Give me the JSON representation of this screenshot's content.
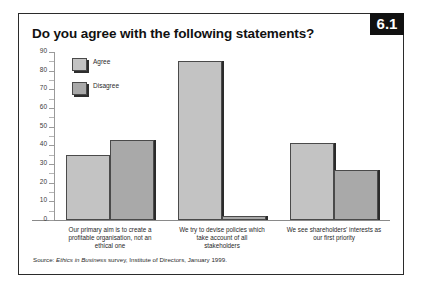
{
  "figure": {
    "number": "6.1",
    "title": "Do you agree with the following statements?",
    "source_prefix": "Source:",
    "source_italic": "Ethics in Business",
    "source_rest": "survey, Institute of Directors, January 1999."
  },
  "chart_data": {
    "type": "bar",
    "title": "Do you agree with the following statements?",
    "xlabel": "",
    "ylabel": "",
    "ylim": [
      0,
      90
    ],
    "yticks": [
      0,
      10,
      20,
      30,
      40,
      50,
      60,
      70,
      80,
      90
    ],
    "grid": false,
    "legend_position": "top-left",
    "categories": [
      "Our primary aim is to create a profitable organisation, not an ethical one",
      "We try to devise policies which take account of all stakeholders",
      "We see shareholders' interests as our first priority"
    ],
    "category_lines": [
      [
        "Our primary aim is to create a",
        "profitable organisation, not an",
        "ethical one"
      ],
      [
        "We try to devise policies which",
        "take account of all",
        "stakeholders"
      ],
      [
        "We see shareholders' interests as",
        "our first priority"
      ]
    ],
    "series": [
      {
        "name": "Agree",
        "color": "#c3c3c3",
        "values": [
          35,
          85,
          41
        ]
      },
      {
        "name": "Disagree",
        "color": "#a9a9a9",
        "values": [
          43,
          2,
          27
        ]
      }
    ]
  }
}
